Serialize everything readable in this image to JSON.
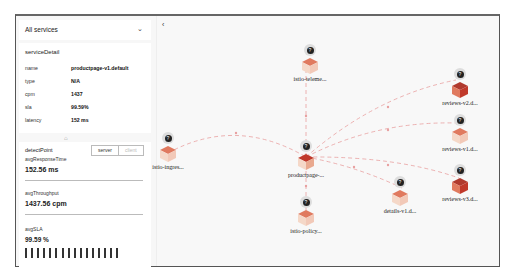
{
  "sidebar": {
    "service_select": "All services",
    "detail": {
      "title": "serviceDetail",
      "rows": [
        {
          "key": "name",
          "value": "productpage-v1.default"
        },
        {
          "key": "type",
          "value": "N/A"
        },
        {
          "key": "cpm",
          "value": "1437"
        },
        {
          "key": "sla",
          "value": "99.59%"
        },
        {
          "key": "latency",
          "value": "152 ms"
        }
      ]
    },
    "metrics": {
      "detect_point_label": "detectPoint",
      "toggle": {
        "server": "server",
        "client": "client",
        "selected": "server"
      },
      "avg_response_time_label": "avgResponseTime",
      "avg_response_time": "152.56 ms",
      "avg_throughput_label": "avgThroughput",
      "avg_throughput": "1437.56 cpm",
      "avg_sla_label": "avgSLA",
      "avg_sla": "99.59 %",
      "sla_bar_count": 16
    }
  },
  "graph": {
    "back_icon": "‹",
    "nodes": [
      {
        "id": "telemetry",
        "label": "istio-teleme..."
      },
      {
        "id": "ingress",
        "label": "istio-ingres..."
      },
      {
        "id": "productpage",
        "label": "productpage-..."
      },
      {
        "id": "policy",
        "label": "istio-policy..."
      },
      {
        "id": "details",
        "label": "details-v1.d..."
      },
      {
        "id": "reviews2",
        "label": "reviews-v2.d..."
      },
      {
        "id": "reviews1",
        "label": "reviews-v1.d..."
      },
      {
        "id": "reviews3",
        "label": "reviews-v3.d..."
      }
    ],
    "colors": {
      "edge": "#e8a0a0",
      "cube_top": "#e07a5f",
      "cube_side": "#f2c9b8",
      "badge": "#222222"
    }
  }
}
